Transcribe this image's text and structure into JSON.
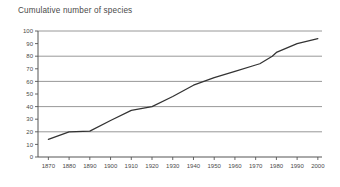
{
  "chart_data": {
    "type": "line",
    "title": "Cumulative number of species",
    "xlabel": "",
    "ylabel": "",
    "xlim": [
      1865,
      2002
    ],
    "ylim": [
      0,
      100
    ],
    "grid": "horizontal-major",
    "legend": "none",
    "line_color": "#333333",
    "grid_color": "#8c8c8c",
    "axis_color": "#555555",
    "x_ticks": [
      1870,
      1880,
      1890,
      1900,
      1910,
      1920,
      1930,
      1940,
      1950,
      1960,
      1970,
      1980,
      1990,
      2000
    ],
    "x_tick_labels": [
      "1870",
      "1880",
      "1890",
      "1900",
      "1910",
      "1920",
      "1930",
      "1940",
      "1950",
      "1960",
      "1970",
      "1980",
      "1990",
      "2000"
    ],
    "y_ticks": [
      0,
      10,
      20,
      30,
      40,
      50,
      60,
      70,
      80,
      90,
      100
    ],
    "y_tick_labels": [
      "0",
      "10",
      "20",
      "30",
      "40",
      "50",
      "60",
      "70",
      "80",
      "90",
      "100"
    ],
    "gridline_values": [
      20,
      40,
      60,
      80,
      100
    ],
    "x": [
      1870,
      1880,
      1890,
      1900,
      1910,
      1920,
      1930,
      1940,
      1945,
      1950,
      1960,
      1970,
      1972,
      1978,
      1980,
      1990,
      2000
    ],
    "values": [
      14,
      20,
      20.5,
      29,
      37,
      40,
      48,
      57,
      60,
      63,
      68,
      73,
      74,
      80,
      83,
      90,
      94
    ],
    "series": [
      {
        "name": "Cumulative number of species",
        "x": [
          1870,
          1880,
          1890,
          1900,
          1910,
          1920,
          1930,
          1940,
          1945,
          1950,
          1960,
          1970,
          1972,
          1978,
          1980,
          1990,
          2000
        ],
        "values": [
          14,
          20,
          20.5,
          29,
          37,
          40,
          48,
          57,
          60,
          63,
          68,
          73,
          74,
          80,
          83,
          90,
          94
        ]
      }
    ]
  }
}
